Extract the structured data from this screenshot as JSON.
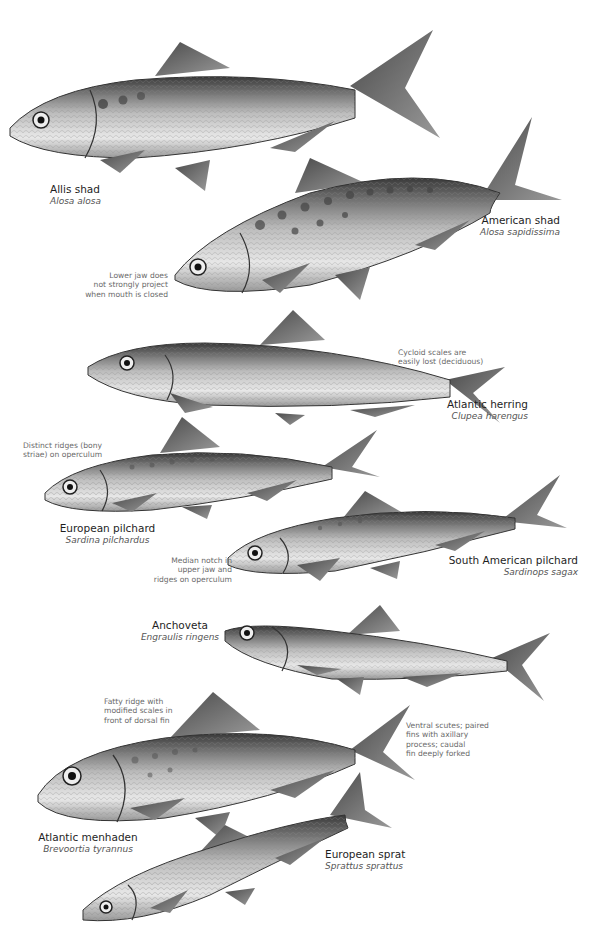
{
  "species": [
    {
      "common": "Allis shad",
      "scientific": "Alosa alosa"
    },
    {
      "common": "American shad",
      "scientific": "Alosa sapidissima"
    },
    {
      "common": "Atlantic herring",
      "scientific": "Clupea harengus"
    },
    {
      "common": "European pilchard",
      "scientific": "Sardina pilchardus"
    },
    {
      "common": "South American pilchard",
      "scientific": "Sardinops sagax"
    },
    {
      "common": "Anchoveta",
      "scientific": "Engraulis ringens"
    },
    {
      "common": "Atlantic menhaden",
      "scientific": "Brevoortia tyrannus"
    },
    {
      "common": "European sprat",
      "scientific": "Sprattus sprattus"
    }
  ],
  "notes": {
    "american_shad": [
      "Lower jaw does",
      "not strongly project",
      "when mouth is closed"
    ],
    "atlantic_herring": [
      "Cycloid scales are",
      "easily lost (deciduous)"
    ],
    "european_pilchard": [
      "Distinct ridges (bony",
      "striae) on operculum"
    ],
    "south_american_pilchard": [
      "Median notch in",
      "upper jaw and",
      "ridges on operculum"
    ],
    "atlantic_menhaden_ridge": [
      "Fatty ridge with",
      "modified scales in",
      "front of dorsal fin"
    ],
    "atlantic_menhaden_scutes": [
      "Ventral scutes; paired",
      "fins with axillary",
      "process; caudal",
      "fin deeply forked"
    ]
  }
}
